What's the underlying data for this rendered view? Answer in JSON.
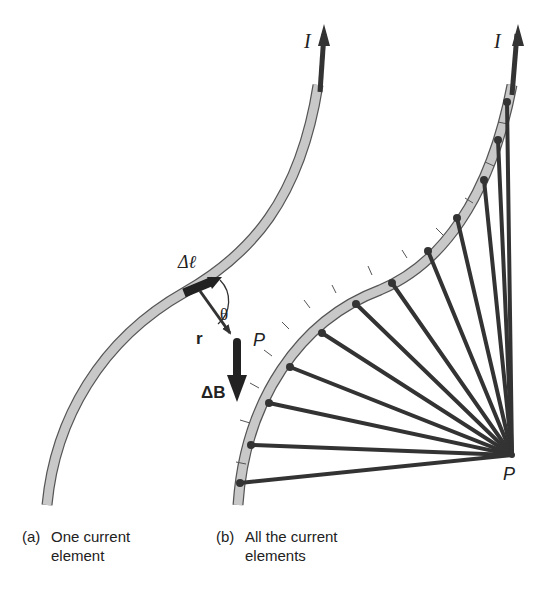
{
  "figure": {
    "panel_a": {
      "current_label": "I",
      "element_label": "Δℓ",
      "angle_label": "θ",
      "r_label": "r",
      "point_label": "P",
      "field_label": "ΔB",
      "caption_tag": "(a)",
      "caption_line1": "One current",
      "caption_line2": "element"
    },
    "panel_b": {
      "current_label": "I",
      "point_label": "P",
      "caption_tag": "(b)",
      "caption_line1": "All the current",
      "caption_line2": "elements",
      "element_count": 14
    },
    "colors": {
      "wire_fill": "#c8c8c8",
      "wire_edge": "#555555",
      "vector": "#333333",
      "text": "#222222"
    }
  }
}
